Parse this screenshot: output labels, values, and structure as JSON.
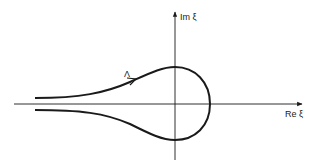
{
  "diagram": {
    "type": "complex-plane contour",
    "axes": {
      "x_label": "Re ξ",
      "y_label": "Im ξ"
    },
    "contour": {
      "label": "Λ",
      "description": "Hankel-type contour: comes from −∞ above the real axis, encircles the origin counterclockwise-direction arrow on upper branch, returns to −∞ below the real axis"
    },
    "colors": {
      "ink": "#1a1a1a",
      "background": "#ffffff"
    }
  }
}
